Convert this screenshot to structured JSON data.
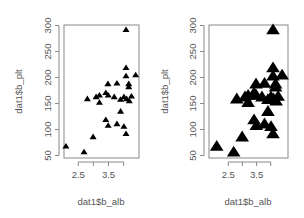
{
  "chart_data": [
    {
      "type": "scatter",
      "title": "",
      "xlabel": "dat1$b_alb",
      "ylabel": "dat1$b_plt",
      "xlim": [
        2.0,
        4.5
      ],
      "ylim": [
        50,
        300
      ],
      "xticks": [
        2.5,
        3.0,
        3.5,
        4.0
      ],
      "xtick_labels": [
        "2.5",
        "",
        "3.5",
        ""
      ],
      "yticks": [
        50,
        100,
        150,
        200,
        250,
        300
      ],
      "ytick_labels": [
        "50",
        "100",
        "150",
        "200",
        "250",
        "300"
      ],
      "marker": "filled-triangle",
      "marker_size": "small",
      "grid": false,
      "points": [
        [
          4.08,
          292
        ],
        [
          4.08,
          219
        ],
        [
          4.08,
          203
        ],
        [
          4.4,
          205
        ],
        [
          4.17,
          188
        ],
        [
          4.17,
          182
        ],
        [
          3.48,
          188
        ],
        [
          3.78,
          189
        ],
        [
          2.8,
          159
        ],
        [
          3.09,
          163
        ],
        [
          3.2,
          166
        ],
        [
          3.2,
          152
        ],
        [
          3.41,
          171
        ],
        [
          3.49,
          166
        ],
        [
          3.69,
          163
        ],
        [
          3.9,
          158
        ],
        [
          4.01,
          163
        ],
        [
          4.1,
          159
        ],
        [
          4.19,
          155
        ],
        [
          4.26,
          164
        ],
        [
          3.9,
          135
        ],
        [
          3.41,
          119
        ],
        [
          3.49,
          108
        ],
        [
          3.78,
          111
        ],
        [
          4.01,
          106
        ],
        [
          4.08,
          92
        ],
        [
          2.99,
          86
        ],
        [
          2.09,
          68
        ],
        [
          2.69,
          57
        ]
      ]
    },
    {
      "type": "scatter",
      "title": "",
      "xlabel": "dat1$b_alb",
      "ylabel": "dat1$b_plt",
      "xlim": [
        1.9,
        4.7
      ],
      "ylim": [
        50,
        300
      ],
      "xticks": [
        2.5,
        3.0,
        3.5,
        4.0
      ],
      "xtick_labels": [
        "2.5",
        "",
        "3.5",
        ""
      ],
      "yticks": [
        50,
        100,
        150,
        200,
        250,
        300
      ],
      "ytick_labels": [
        "50",
        "100",
        "150",
        "200",
        "250",
        "300"
      ],
      "marker": "filled-triangle",
      "marker_size": "large",
      "grid": false,
      "points": [
        [
          4.08,
          292
        ],
        [
          4.08,
          219
        ],
        [
          4.08,
          203
        ],
        [
          4.4,
          205
        ],
        [
          4.17,
          188
        ],
        [
          4.17,
          182
        ],
        [
          3.48,
          188
        ],
        [
          3.78,
          189
        ],
        [
          2.8,
          159
        ],
        [
          3.09,
          163
        ],
        [
          3.2,
          166
        ],
        [
          3.2,
          152
        ],
        [
          3.41,
          171
        ],
        [
          3.49,
          166
        ],
        [
          3.69,
          163
        ],
        [
          3.9,
          158
        ],
        [
          4.01,
          163
        ],
        [
          4.1,
          159
        ],
        [
          4.19,
          155
        ],
        [
          4.26,
          164
        ],
        [
          3.9,
          135
        ],
        [
          3.41,
          119
        ],
        [
          3.49,
          108
        ],
        [
          3.78,
          111
        ],
        [
          4.01,
          106
        ],
        [
          4.08,
          92
        ],
        [
          2.99,
          86
        ],
        [
          2.09,
          68
        ],
        [
          2.69,
          57
        ]
      ]
    }
  ],
  "panels": [
    {
      "box": {
        "x0": 64,
        "y0": 25,
        "x1": 139,
        "y1": 158
      },
      "xmap": {
        "v0": 2.5,
        "p0": 78.3,
        "ppu": 30.2
      },
      "ymap": {
        "v0": 50,
        "p0": 155.5,
        "ppu": 0.52
      },
      "tri": 3.2,
      "ylabel_x": 22,
      "xlabel_x": 101
    },
    {
      "box": {
        "x0": 209,
        "y0": 25,
        "x1": 288,
        "y1": 158
      },
      "xmap": {
        "v0": 2.5,
        "p0": 228.3,
        "ppu": 28.3
      },
      "ymap": {
        "v0": 50,
        "p0": 155.5,
        "ppu": 0.52
      },
      "tri": 6.2,
      "ylabel_x": 168,
      "xlabel_x": 248
    }
  ],
  "colors": {
    "axis": "#888888",
    "marker": "#000000",
    "text": "#555555"
  }
}
